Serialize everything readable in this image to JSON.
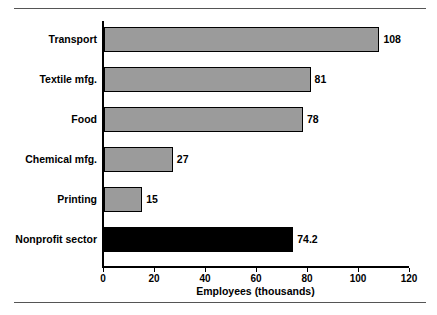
{
  "chart_data": {
    "type": "bar",
    "orientation": "horizontal",
    "title": "",
    "xlabel": "Employees (thousands)",
    "ylabel": "",
    "xlim": [
      0,
      120
    ],
    "xticks": [
      0,
      20,
      40,
      60,
      80,
      100,
      120
    ],
    "xtick_labels": [
      "0",
      "20",
      "40",
      "60",
      "80",
      "100",
      "120"
    ],
    "grid": false,
    "legend": null,
    "categories": [
      "Transport",
      "Textile mfg.",
      "Food",
      "Chemical mfg.",
      "Printing",
      "Nonprofit sector"
    ],
    "values": [
      108,
      81,
      78,
      27,
      15,
      74.2
    ],
    "value_labels": [
      "108",
      "81",
      "78",
      "27",
      "15",
      "74.2"
    ],
    "bar_colors": [
      "#9b9b9b",
      "#9b9b9b",
      "#9b9b9b",
      "#9b9b9b",
      "#9b9b9b",
      "#000000"
    ],
    "bars": [
      {
        "category": "Transport",
        "value": 108,
        "label": "108",
        "color": "#9b9b9b"
      },
      {
        "category": "Textile mfg.",
        "value": 81,
        "label": "81",
        "color": "#9b9b9b"
      },
      {
        "category": "Food",
        "value": 78,
        "label": "78",
        "color": "#9b9b9b"
      },
      {
        "category": "Chemical mfg.",
        "value": 27,
        "label": "27",
        "color": "#9b9b9b"
      },
      {
        "category": "Printing",
        "value": 15,
        "label": "15",
        "color": "#9b9b9b"
      },
      {
        "category": "Nonprofit sector",
        "value": 74.2,
        "label": "74.2",
        "color": "#000000"
      }
    ]
  }
}
